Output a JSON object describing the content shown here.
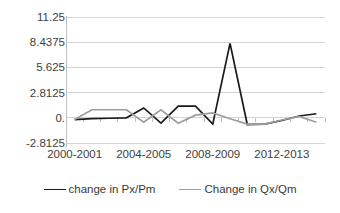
{
  "chart_data": {
    "type": "line",
    "title": "",
    "xlabel": "",
    "ylabel": "",
    "grid": true,
    "legend_position": "bottom",
    "ylim": [
      -2.8125,
      11.25
    ],
    "ytick_labels": [
      "11.25",
      "8.4375",
      "5.625",
      "2.8125",
      "0.",
      "-2.8125"
    ],
    "ytick_values": [
      11.25,
      8.4375,
      5.625,
      2.8125,
      0,
      -2.8125
    ],
    "categories": [
      "2000-2001",
      "2001-2002",
      "2002-2003",
      "2003-2004",
      "2004-2005",
      "2005-2006",
      "2006-2007",
      "2007-2008",
      "2008-2009",
      "2009-2010",
      "2010-2011",
      "2011-2012",
      "2012-2013",
      "2013-2014",
      "2014-2015"
    ],
    "xtick_labels_shown": [
      "2000-2001",
      "2004-2005",
      "2008-2009",
      "2012-2013"
    ],
    "xtick_label_indices": [
      0,
      4,
      8,
      12
    ],
    "series": [
      {
        "name": "change in Px/Pm",
        "color": "#1a1a1a",
        "values": [
          -0.2,
          -0.1,
          -0.05,
          0.0,
          1.1,
          -0.6,
          1.3,
          1.3,
          -0.7,
          8.3,
          -0.75,
          -0.7,
          -0.3,
          0.2,
          0.45
        ]
      },
      {
        "name": "Change in Qx/Qm",
        "color": "#9d9d9d",
        "values": [
          -0.2,
          0.9,
          0.9,
          0.9,
          -0.5,
          0.9,
          -0.6,
          0.3,
          0.55,
          -0.1,
          -0.7,
          -0.7,
          -0.25,
          0.15,
          -0.5
        ]
      }
    ]
  },
  "legend": {
    "items": [
      {
        "label": "change in Px/Pm",
        "color": "#1a1a1a"
      },
      {
        "label": "Change in Qx/Qm",
        "color": "#9d9d9d"
      }
    ]
  },
  "colors": {
    "gridline": "#d4d4d4",
    "axis": "#bfbfbf",
    "series_primary": "#1a1a1a",
    "series_secondary": "#9d9d9d",
    "text": "#404040",
    "background": "#ffffff"
  }
}
